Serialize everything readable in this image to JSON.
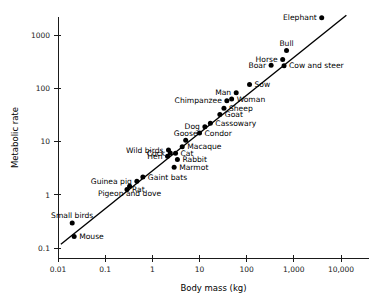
{
  "chart_data": {
    "type": "scatter",
    "title": "",
    "xlabel": "Body mass (kg)",
    "ylabel": "Metabolic rate",
    "xscale": "log",
    "yscale": "log",
    "xlim": [
      0.01,
      20000
    ],
    "ylim": [
      0.1,
      3000
    ],
    "grid": false,
    "legend": false,
    "xticks": [
      {
        "value": 0.01,
        "label": "0.01"
      },
      {
        "value": 0.1,
        "label": "0.1"
      },
      {
        "value": 1,
        "label": "1"
      },
      {
        "value": 10,
        "label": "10"
      },
      {
        "value": 100,
        "label": "100"
      },
      {
        "value": 1000,
        "label": "1,000"
      },
      {
        "value": 10000,
        "label": "10,000"
      }
    ],
    "yticks": [
      {
        "value": 0.1,
        "label": "0.1"
      },
      {
        "value": 1,
        "label": "1"
      },
      {
        "value": 10,
        "label": "10"
      },
      {
        "value": 100,
        "label": "100"
      },
      {
        "value": 1000,
        "label": "1000"
      }
    ],
    "fit_line": {
      "name": "allometric-regression-line",
      "x_start": 0.0115,
      "y_start": 0.118,
      "x_end": 13000,
      "y_end": 2350
    },
    "points": [
      {
        "name": "Mouse",
        "x": 0.022,
        "y": 0.165,
        "label_pos": "right"
      },
      {
        "name": "Small birds",
        "x": 0.02,
        "y": 0.295,
        "label_pos": "above"
      },
      {
        "name": "Rat",
        "x": 0.29,
        "y": 1.25,
        "label_pos": "right"
      },
      {
        "name": "Pigeon and dove",
        "x": 0.33,
        "y": 1.45,
        "label_pos": "below"
      },
      {
        "name": "Guinea pig",
        "x": 0.47,
        "y": 1.8,
        "label_pos": "left"
      },
      {
        "name": "Gaint bats",
        "x": 0.63,
        "y": 2.15,
        "label_pos": "right"
      },
      {
        "name": "Marmot",
        "x": 2.9,
        "y": 3.3,
        "label_pos": "right"
      },
      {
        "name": "Rabbit",
        "x": 3.4,
        "y": 4.6,
        "label_pos": "right"
      },
      {
        "name": "Hen",
        "x": 2.1,
        "y": 5.3,
        "label_pos": "left"
      },
      {
        "name": "Cock",
        "x": 2.4,
        "y": 6.1,
        "label_pos": "left"
      },
      {
        "name": "Cat",
        "x": 3.1,
        "y": 6.0,
        "label_pos": "right"
      },
      {
        "name": "Wild birds",
        "x": 2.2,
        "y": 6.9,
        "label_pos": "left"
      },
      {
        "name": "Macaque",
        "x": 4.3,
        "y": 8.0,
        "label_pos": "right"
      },
      {
        "name": "Goose",
        "x": 5.1,
        "y": 10.5,
        "label_pos": "above"
      },
      {
        "name": "Condor",
        "x": 10.0,
        "y": 14.5,
        "label_pos": "right"
      },
      {
        "name": "Dog",
        "x": 13.0,
        "y": 19.0,
        "label_pos": "left"
      },
      {
        "name": "Cassowary",
        "x": 17.0,
        "y": 22.0,
        "label_pos": "right"
      },
      {
        "name": "Goat",
        "x": 27.0,
        "y": 32.0,
        "label_pos": "right"
      },
      {
        "name": "Sheep",
        "x": 33.0,
        "y": 42.0,
        "label_pos": "right"
      },
      {
        "name": "Chimpanzee",
        "x": 38.0,
        "y": 58.0,
        "label_pos": "left"
      },
      {
        "name": "Woman",
        "x": 48.0,
        "y": 63.0,
        "label_pos": "right"
      },
      {
        "name": "Man",
        "x": 60.0,
        "y": 82.0,
        "label_pos": "left"
      },
      {
        "name": "Sow",
        "x": 115.0,
        "y": 118.0,
        "label_pos": "right"
      },
      {
        "name": "Boar",
        "x": 330.0,
        "y": 270.0,
        "label_pos": "left"
      },
      {
        "name": "Cow and steer",
        "x": 620.0,
        "y": 265.0,
        "label_pos": "right"
      },
      {
        "name": "Horse",
        "x": 580.0,
        "y": 345.0,
        "label_pos": "left"
      },
      {
        "name": "Bull",
        "x": 700.0,
        "y": 510.0,
        "label_pos": "above"
      },
      {
        "name": "Elephant",
        "x": 3900.0,
        "y": 2100.0,
        "label_pos": "left"
      }
    ]
  }
}
